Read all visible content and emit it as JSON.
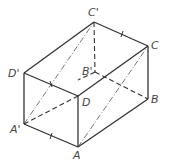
{
  "figure": {
    "stroke_color": "#333333",
    "label_color": "#444444"
  },
  "vertices": {
    "C_prime": {
      "label": "C'",
      "x": 94,
      "y": 22
    },
    "C": {
      "label": "C",
      "x": 148,
      "y": 46
    },
    "D_prime": {
      "label": "D'",
      "x": 24,
      "y": 73
    },
    "D": {
      "label": "D",
      "x": 78,
      "y": 96
    },
    "B_prime": {
      "label": "B'",
      "x": 95,
      "y": 72
    },
    "B": {
      "label": "B",
      "x": 148,
      "y": 99
    },
    "A_prime": {
      "label": "A'",
      "x": 24,
      "y": 124
    },
    "A": {
      "label": "A",
      "x": 78,
      "y": 147
    }
  },
  "edges": {
    "solid": [
      [
        "D_prime",
        "C_prime"
      ],
      [
        "C_prime",
        "C"
      ],
      [
        "D_prime",
        "D"
      ],
      [
        "D",
        "C"
      ],
      [
        "D_prime",
        "A_prime"
      ],
      [
        "D",
        "A"
      ],
      [
        "A_prime",
        "A"
      ],
      [
        "A",
        "B"
      ],
      [
        "C",
        "B"
      ]
    ],
    "hidden": [
      [
        "C_prime",
        "B_prime"
      ],
      [
        "B_prime",
        "B"
      ],
      [
        "B_prime",
        "A_prime"
      ]
    ],
    "diagonals_dashed": [
      [
        "A_prime",
        "D"
      ]
    ],
    "diagonals_chain": [
      [
        "A_prime",
        "C_prime"
      ],
      [
        "A",
        "C"
      ]
    ]
  },
  "tick_marks": [
    {
      "edge": "C_prime-C",
      "mark": "I"
    },
    {
      "edge": "A_prime-A",
      "mark": "I"
    },
    {
      "edge": "D_prime-C_prime-diag",
      "mark": "I"
    }
  ]
}
